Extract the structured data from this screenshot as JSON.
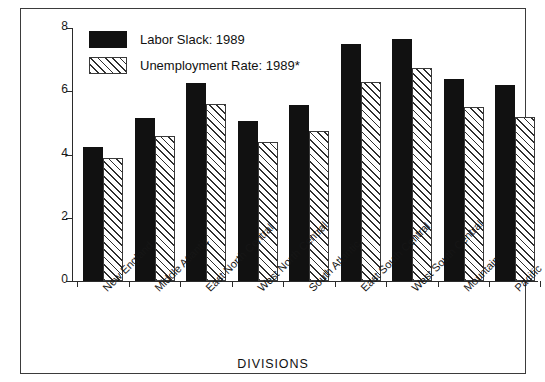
{
  "figure": {
    "top_sliver_text": "",
    "x_axis_title": "DIVISIONS"
  },
  "legend": {
    "entries": [
      {
        "label": "Labor Slack: 1989",
        "swatch": "solid-black-swatch",
        "color": "#111111"
      },
      {
        "label": "Unemployment Rate: 1989*",
        "swatch": "diagonal-hatch-swatch",
        "color": "#ffffff"
      }
    ]
  },
  "y_axis": {
    "ticks": [
      "0",
      "2",
      "4",
      "6",
      "8"
    ]
  },
  "chart_data": {
    "type": "bar",
    "title": "",
    "xlabel": "DIVISIONS",
    "ylabel": "",
    "ylim": [
      0,
      8
    ],
    "yticks": [
      0,
      2,
      4,
      6,
      8
    ],
    "grid": false,
    "legend_position": "top-left-inside",
    "categories": [
      "New England",
      "Middle Atlantic",
      "East North Central",
      "West North Central",
      "South Atlantic",
      "East South Central",
      "West South Central",
      "Mountain",
      "Pacific"
    ],
    "series": [
      {
        "name": "Labor Slack: 1989",
        "style": "solid-black",
        "values": [
          4.25,
          5.15,
          6.25,
          5.05,
          5.55,
          7.5,
          7.65,
          6.4,
          6.2
        ]
      },
      {
        "name": "Unemployment Rate: 1989*",
        "style": "diagonal-hatch",
        "values": [
          3.9,
          4.6,
          5.6,
          4.4,
          4.75,
          6.3,
          6.75,
          5.5,
          5.2
        ]
      }
    ]
  }
}
